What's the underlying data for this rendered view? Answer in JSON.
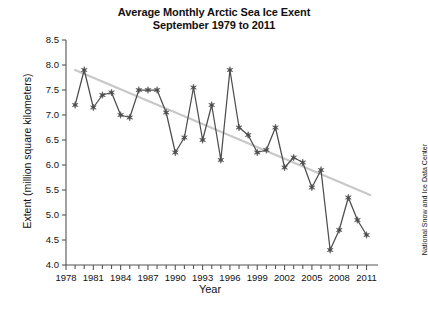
{
  "figure": {
    "title_line1": "Average Monthly Arctic Sea Ice Exent",
    "title_line2": "September 1979 to 2011",
    "credit": "National Snow and Ice Data Center",
    "background_color": "#ffffff",
    "series_color": "#4d4d4d",
    "trend_color": "#c8c8c8",
    "axis_color": "#555555",
    "text_color": "#111111"
  },
  "chart_data": {
    "type": "line",
    "title": "Average Monthly Arctic Sea Ice Exent September 1979 to 2011",
    "xlabel": "Year",
    "ylabel": "Extent (million square kilometers)",
    "xlim": [
      1978,
      2011.6
    ],
    "ylim": [
      4.0,
      8.5
    ],
    "grid": false,
    "legend": "none",
    "x_tick_labels": [
      "1978",
      "1981",
      "1984",
      "1987",
      "1990",
      "1993",
      "1996",
      "1999",
      "2002",
      "2005",
      "2008",
      "2011"
    ],
    "x_major_ticks": [
      1978,
      1981,
      1984,
      1987,
      1990,
      1993,
      1996,
      1999,
      2002,
      2005,
      2008,
      2011
    ],
    "x_minor_tick_interval": 1,
    "y_tick_labels": [
      "4.0",
      "4.5",
      "5.0",
      "5.5",
      "6.0",
      "6.5",
      "7.0",
      "7.5",
      "8.0",
      "8.5"
    ],
    "y_ticks": [
      4.0,
      4.5,
      5.0,
      5.5,
      6.0,
      6.5,
      7.0,
      7.5,
      8.0,
      8.5
    ],
    "marker": "star",
    "x": [
      1979,
      1980,
      1981,
      1982,
      1983,
      1984,
      1985,
      1986,
      1987,
      1988,
      1989,
      1990,
      1991,
      1992,
      1993,
      1994,
      1995,
      1996,
      1997,
      1998,
      1999,
      2000,
      2001,
      2002,
      2003,
      2004,
      2005,
      2006,
      2007,
      2008,
      2009,
      2010,
      2011
    ],
    "values": [
      7.2,
      7.9,
      7.15,
      7.4,
      7.45,
      7.0,
      6.95,
      7.5,
      7.5,
      7.5,
      7.05,
      6.25,
      6.55,
      7.55,
      6.5,
      7.2,
      6.1,
      7.9,
      6.75,
      6.6,
      6.25,
      6.3,
      6.75,
      5.95,
      6.15,
      6.05,
      5.55,
      5.9,
      4.3,
      4.7,
      5.35,
      4.9,
      4.6
    ],
    "trendline": {
      "label": "linear trend",
      "x_start": 1979,
      "y_start": 7.9,
      "x_end": 2011.4,
      "y_end": 5.4
    }
  }
}
